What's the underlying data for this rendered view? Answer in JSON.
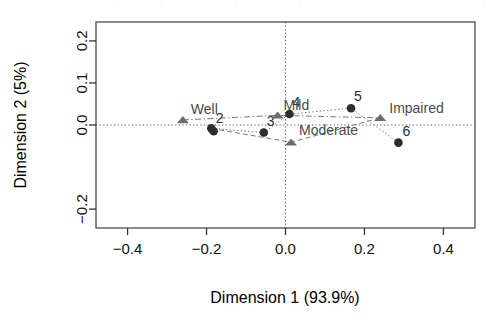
{
  "chart_data": {
    "type": "scatter",
    "title": "",
    "xlabel": "Dimension 1 (93.9%)",
    "ylabel": "Dimension 2 (5%)",
    "xlim": [
      -0.48,
      0.48
    ],
    "ylim": [
      -0.245,
      0.245
    ],
    "xticks": [
      "-0.4",
      "-0.2",
      "0.0",
      "0.2",
      "0.4"
    ],
    "xtick_values": [
      -0.4,
      -0.2,
      0.0,
      0.2,
      0.4
    ],
    "yticks": [
      "0.2",
      "0.1",
      "0.0",
      "-0.2"
    ],
    "ytick_values": [
      0.2,
      0.1,
      0.0,
      -0.2
    ],
    "grid": false,
    "legend": "none",
    "reference_lines": {
      "horizontal_at": 0.0,
      "vertical_at": 0.0,
      "style": "dotted"
    },
    "series": [
      {
        "name": "Observations",
        "marker": "filled-circle",
        "color": "#2e2e2e",
        "points": [
          {
            "label": "1",
            "x": -0.188,
            "y": -0.008,
            "label_dx": 2,
            "label_dy": -6,
            "label_visible": false
          },
          {
            "label": "2",
            "x": -0.182,
            "y": -0.015,
            "label_dx": 2,
            "label_dy": -8,
            "label_visible": true
          },
          {
            "label": "3",
            "x": -0.055,
            "y": -0.018,
            "label_dx": 3,
            "label_dy": -7,
            "label_visible": true
          },
          {
            "label": "4",
            "x": 0.01,
            "y": 0.026,
            "label_dx": 3,
            "label_dy": -7,
            "label_visible": true
          },
          {
            "label": "5",
            "x": 0.166,
            "y": 0.04,
            "label_dx": 3,
            "label_dy": -7,
            "label_visible": true
          },
          {
            "label": "6",
            "x": 0.286,
            "y": -0.042,
            "label_dx": 4,
            "label_dy": -7,
            "label_visible": true
          }
        ]
      },
      {
        "name": "Categories",
        "marker": "filled-triangle",
        "color": "#6e6e6e",
        "points": [
          {
            "label": "Well",
            "x": -0.26,
            "y": 0.012,
            "label_dx": 8,
            "label_dy": -6
          },
          {
            "label": "Mild",
            "x": -0.02,
            "y": 0.023,
            "label_dx": 6,
            "label_dy": -5
          },
          {
            "label": "Moderate",
            "x": 0.014,
            "y": -0.041,
            "label_dx": 8,
            "label_dy": -7
          },
          {
            "label": "Impaired",
            "x": 0.24,
            "y": 0.017,
            "label_dx": 9,
            "label_dy": -5
          }
        ]
      }
    ],
    "connector_paths": [
      {
        "name": "dotted-observation-path",
        "style": "dotted",
        "vertices": [
          [
            -0.188,
            -0.008
          ],
          [
            -0.055,
            -0.018
          ],
          [
            0.01,
            0.026
          ],
          [
            0.166,
            0.04
          ],
          [
            0.286,
            -0.042
          ]
        ]
      },
      {
        "name": "dashdot-well-mild-path",
        "style": "dashdot",
        "vertices": [
          [
            -0.26,
            0.012
          ],
          [
            -0.02,
            0.023
          ],
          [
            0.24,
            0.017
          ]
        ]
      },
      {
        "name": "dashed-moderate-path",
        "style": "dashed",
        "vertices": [
          [
            -0.188,
            -0.008
          ],
          [
            0.014,
            -0.041
          ],
          [
            0.24,
            0.017
          ]
        ]
      }
    ]
  },
  "axes": {
    "x_title": "Dimension 1 (93.9%)",
    "y_title": "Dimension 2 (5%)"
  }
}
